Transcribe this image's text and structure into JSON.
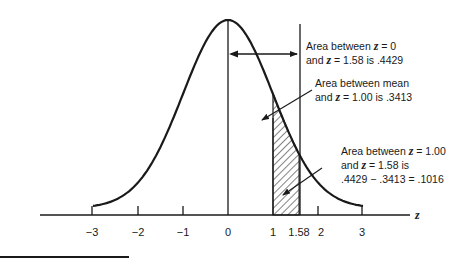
{
  "chart_data": {
    "type": "area",
    "title": "",
    "xlabel": "z",
    "ylabel": "",
    "curve": "standard normal distribution",
    "x_ticks": [
      "-3",
      "-2",
      "-1",
      "0",
      "1",
      "1.58",
      "2",
      "3"
    ],
    "x_tick_values": [
      -3,
      -2,
      -1,
      0,
      1,
      1.58,
      2,
      3
    ],
    "xlim": [
      -3.2,
      4.0
    ],
    "shaded_region": {
      "from": 1.0,
      "to": 1.58,
      "area": 0.1016,
      "style": "hatched"
    },
    "vertical_lines": [
      0,
      1.58
    ],
    "annotations": [
      {
        "id": "a1",
        "lines": [
          "Area between z = 0",
          "and z = 1.58 is .4429"
        ],
        "value": 0.4429,
        "range": [
          0,
          1.58
        ]
      },
      {
        "id": "a2",
        "lines": [
          "Area between mean",
          "and z = 1.00 is .3413"
        ],
        "value": 0.3413,
        "range": [
          0,
          1.0
        ]
      },
      {
        "id": "a3",
        "lines": [
          "Area between z = 1.00",
          "and z = 1.58 is",
          ".4429 − .3413 = .1016"
        ],
        "value": 0.1016,
        "range": [
          1.0,
          1.58
        ]
      }
    ],
    "grid": false,
    "legend": "none"
  },
  "labels": {
    "ticks": [
      "−3",
      "−2",
      "−1",
      "0",
      "1",
      "1.58",
      "2",
      "3"
    ],
    "axis_var": "z",
    "ann1": {
      "l1a": "Area between ",
      "l1z": "z",
      "l1b": " = 0",
      "l2a": "and ",
      "l2z": "z",
      "l2b": " = 1.58 is .4429"
    },
    "ann2": {
      "l1": "Area between mean",
      "l2a": "and ",
      "l2z": "z",
      "l2b": " = 1.00 is .3413"
    },
    "ann3": {
      "l1a": "Area between ",
      "l1z": "z",
      "l1b": " = 1.00",
      "l2a": "and ",
      "l2z": "z",
      "l2b": " = 1.58 is",
      "l3": ".4429 − .3413 = .1016"
    }
  },
  "colors": {
    "ink": "#1a1a1a",
    "background": "#ffffff"
  }
}
